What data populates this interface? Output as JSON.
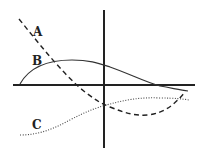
{
  "diagram": {
    "type": "function-curves-on-axes",
    "axes": {
      "horizontal": {
        "x1": 13,
        "y1": 85,
        "x2": 195,
        "y2": 85
      },
      "vertical": {
        "x1": 104,
        "y1": 10,
        "x2": 104,
        "y2": 148
      },
      "color": "#222222"
    },
    "curves": [
      {
        "label": "A",
        "style": "dashed",
        "path": "M19,19 C40,45 60,70 80,88 C95,100 100,103 110,107 C125,113 135,116 148,115 C165,113 175,104 185,92",
        "label_pos": {
          "x": 33,
          "y": 36
        }
      },
      {
        "label": "B",
        "style": "solid",
        "path": "M20,84 C30,66 50,60 72,60 C90,60 98,63 110,67 C130,74 145,82 160,86 C172,88 180,90 188,91",
        "label_pos": {
          "x": 32,
          "y": 65
        }
      },
      {
        "label": "C",
        "style": "dotted",
        "path": "M20,135 C40,135 55,128 70,120 C85,112 95,108 110,104 C125,100 140,97 160,98 C175,98 183,99 189,100",
        "label_pos": {
          "x": 32,
          "y": 129
        }
      }
    ]
  }
}
